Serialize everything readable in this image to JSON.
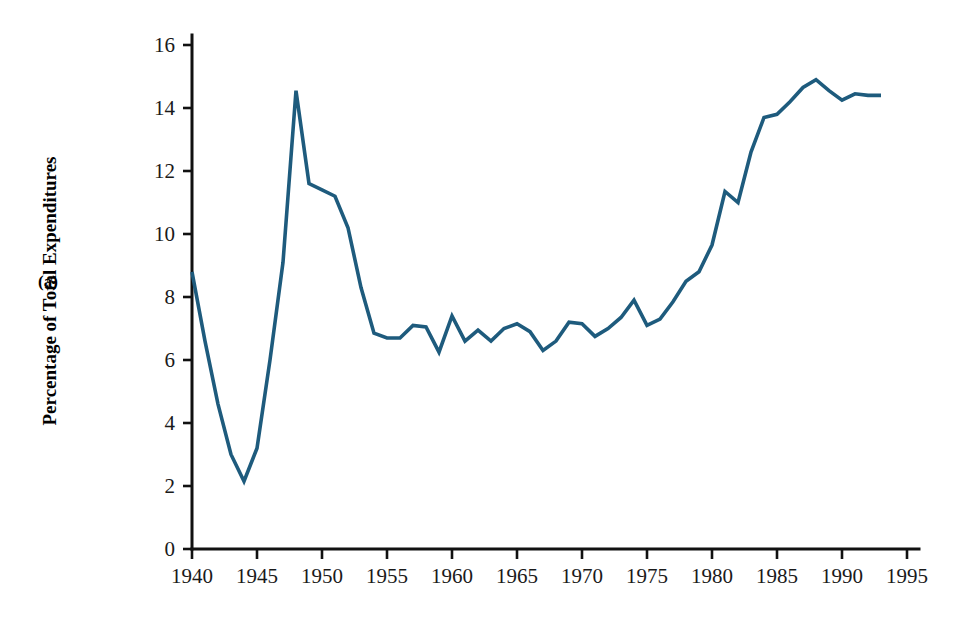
{
  "figure": {
    "panel_label": "(a)",
    "background_color": "#ffffff"
  },
  "chart_data": {
    "type": "line",
    "title": "",
    "subtitle": "",
    "xlabel": "",
    "ylabel": "Percentage of Total Expenditures",
    "xlim": [
      1940,
      1995
    ],
    "ylim": [
      0,
      16
    ],
    "xticks": [
      1940,
      1945,
      1950,
      1955,
      1960,
      1965,
      1970,
      1975,
      1980,
      1985,
      1990,
      1995
    ],
    "xtick_labels": [
      "1940",
      "1945",
      "1950",
      "1955",
      "1960",
      "1965",
      "1970",
      "1975",
      "1980",
      "1985",
      "1990",
      "1995"
    ],
    "yticks": [
      0,
      2,
      4,
      6,
      8,
      10,
      12,
      14,
      16
    ],
    "ytick_labels": [
      "0",
      "2",
      "4",
      "6",
      "8",
      "10",
      "12",
      "14",
      "16"
    ],
    "grid": false,
    "legend": false,
    "legend_position": "none",
    "line_color": "#1e5b7d",
    "line_width": 3.6,
    "series": [
      {
        "name": "Percentage of Total Expenditures",
        "color": "#1e5b7d",
        "x": [
          1940,
          1941,
          1942,
          1943,
          1944,
          1945,
          1946,
          1947,
          1948,
          1949,
          1950,
          1951,
          1952,
          1953,
          1954,
          1955,
          1956,
          1957,
          1958,
          1959,
          1960,
          1961,
          1962,
          1963,
          1964,
          1965,
          1966,
          1967,
          1968,
          1969,
          1970,
          1971,
          1972,
          1973,
          1974,
          1975,
          1976,
          1977,
          1978,
          1979,
          1980,
          1981,
          1982,
          1983,
          1984,
          1985,
          1986,
          1987,
          1988,
          1989,
          1990,
          1991,
          1992,
          1993
        ],
        "y": [
          8.8,
          6.6,
          4.6,
          3.0,
          2.15,
          3.2,
          6.0,
          9.1,
          14.55,
          11.6,
          11.4,
          11.2,
          10.2,
          8.3,
          6.85,
          6.7,
          6.7,
          7.1,
          7.05,
          6.25,
          7.4,
          6.6,
          6.95,
          6.6,
          7.0,
          7.15,
          6.9,
          6.3,
          6.6,
          7.2,
          7.15,
          6.75,
          7.0,
          7.35,
          7.9,
          7.1,
          7.3,
          7.85,
          8.5,
          8.8,
          9.65,
          11.35,
          11.0,
          12.6,
          13.7,
          13.8,
          14.2,
          14.65,
          14.9,
          14.55,
          14.25,
          14.45,
          14.4,
          14.4
        ]
      }
    ]
  }
}
